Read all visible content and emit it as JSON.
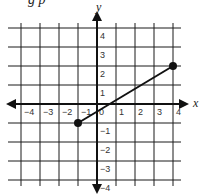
{
  "header": {
    "partial_text": "g p"
  },
  "chart_data": {
    "type": "line",
    "title": "",
    "xlabel": "x",
    "ylabel": "y",
    "xlim": [
      -4,
      4
    ],
    "ylim": [
      -4,
      4
    ],
    "grid": true,
    "x_ticks": [
      -4,
      -3,
      -2,
      -1,
      0,
      1,
      2,
      3,
      4
    ],
    "y_ticks": [
      -4,
      -3,
      -2,
      -1,
      1,
      2,
      3,
      4
    ],
    "x_tick_labels": [
      "−4",
      "−3",
      "−2",
      "−1",
      "0",
      "1",
      "2",
      "3",
      "4"
    ],
    "y_tick_labels": [
      "−4",
      "−3",
      "−2",
      "−1",
      "1",
      "2",
      "3",
      "4"
    ],
    "series": [
      {
        "name": "segment",
        "points": [
          [
            -1,
            -1
          ],
          [
            4,
            2
          ]
        ],
        "endpoints": "closed-dots"
      }
    ]
  },
  "colors": {
    "grid": "#1a1a1a",
    "line": "#111111",
    "background": "#ffffff"
  }
}
